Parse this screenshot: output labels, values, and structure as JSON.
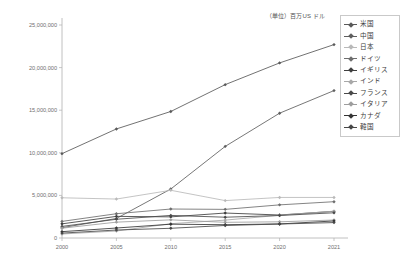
{
  "unit_caption": "（単位）百万US ドル",
  "legend": {
    "position": "top-right",
    "items": [
      {
        "label": "米国",
        "color": "#595959",
        "marker": "diamond"
      },
      {
        "label": "中国",
        "color": "#5f5f5f",
        "marker": "diamond"
      },
      {
        "label": "日本",
        "color": "#b9b9b9",
        "marker": "diamond"
      },
      {
        "label": "ドイツ",
        "color": "#6e6e6e",
        "marker": "diamond"
      },
      {
        "label": "イギリス",
        "color": "#3f3f3f",
        "marker": "diamond"
      },
      {
        "label": "インド",
        "color": "#a8a8a8",
        "marker": "diamond"
      },
      {
        "label": "フランス",
        "color": "#4a4a4a",
        "marker": "diamond"
      },
      {
        "label": "イタリア",
        "color": "#9d9d9d",
        "marker": "diamond"
      },
      {
        "label": "カナダ",
        "color": "#343434",
        "marker": "diamond"
      },
      {
        "label": "韓国",
        "color": "#474747",
        "marker": "diamond"
      }
    ]
  },
  "axes": {
    "y_ticks": [
      "0",
      "5,000,000",
      "10,000,000",
      "15,000,000",
      "20,000,000",
      "25,000,000"
    ],
    "x_ticks": [
      "2000",
      "2005",
      "2010",
      "2015",
      "2020",
      "2021"
    ],
    "ylim": [
      0,
      25000000
    ],
    "grid": false
  },
  "chart_data": {
    "type": "line",
    "title": "",
    "subtitle": "",
    "xlabel": "",
    "ylabel": "",
    "unit": "百万US ドル",
    "categories": [
      "2000",
      "2005",
      "2010",
      "2015",
      "2020",
      "2021"
    ],
    "x": [
      2000,
      2005,
      2010,
      2015,
      2020,
      2021
    ],
    "ylim": [
      0,
      25000000
    ],
    "ytick_step": 5000000,
    "legend_position": "top-right",
    "series": [
      {
        "name": "米国",
        "color": "#595959",
        "values": [
          9900000,
          12800000,
          14850000,
          18000000,
          20550000,
          22700000
        ]
      },
      {
        "name": "中国",
        "color": "#5f5f5f",
        "values": [
          1210000,
          2290000,
          5750000,
          10750000,
          14650000,
          17300000
        ]
      },
      {
        "name": "日本",
        "color": "#b9b9b9",
        "values": [
          4720000,
          4570000,
          5600000,
          4390000,
          4760000,
          4760000
        ]
      },
      {
        "name": "ドイツ",
        "color": "#6e6e6e",
        "values": [
          1950000,
          2850000,
          3400000,
          3360000,
          3890000,
          4260000
        ]
      },
      {
        "name": "イギリス",
        "color": "#3f3f3f",
        "values": [
          1660000,
          2540000,
          2480000,
          2930000,
          2700000,
          3130000
        ]
      },
      {
        "name": "インド",
        "color": "#a8a8a8",
        "values": [
          470000,
          820000,
          1680000,
          2100000,
          2670000,
          3150000
        ]
      },
      {
        "name": "フランス",
        "color": "#4a4a4a",
        "values": [
          1360000,
          2200000,
          2650000,
          2440000,
          2640000,
          2960000
        ]
      },
      {
        "name": "イタリア",
        "color": "#9d9d9d",
        "values": [
          1150000,
          1860000,
          2130000,
          1840000,
          1900000,
          2110000
        ]
      },
      {
        "name": "カナダ",
        "color": "#343434",
        "values": [
          744000,
          1170000,
          1620000,
          1560000,
          1650000,
          2000000
        ]
      },
      {
        "name": "韓国",
        "color": "#474747",
        "values": [
          576000,
          935000,
          1140000,
          1470000,
          1640000,
          1810000
        ]
      }
    ]
  }
}
